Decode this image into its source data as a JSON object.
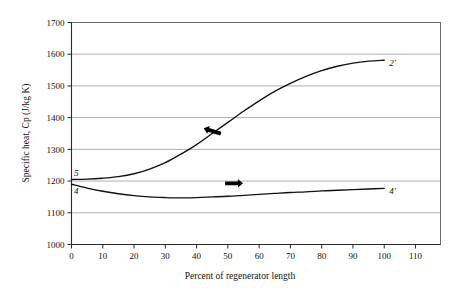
{
  "chart_data": {
    "type": "line",
    "title": "",
    "xlabel": "Percent of regenerator length",
    "ylabel": "Specific heat, Cp (J/kg K)",
    "xlim": [
      0,
      118
    ],
    "ylim": [
      1000,
      1700
    ],
    "xticks": [
      0,
      10,
      20,
      30,
      40,
      50,
      60,
      70,
      80,
      90,
      100,
      110
    ],
    "yticks": [
      1000,
      1100,
      1200,
      1300,
      1400,
      1500,
      1600,
      1700
    ],
    "grid": "horizontal",
    "legend": "none",
    "series": [
      {
        "name": "hot stream",
        "start_label": "5",
        "end_label": "2'",
        "x": [
          0,
          5,
          10,
          15,
          20,
          25,
          30,
          35,
          40,
          45,
          50,
          55,
          60,
          65,
          70,
          75,
          80,
          85,
          90,
          95,
          100
        ],
        "values": [
          1205,
          1206,
          1209,
          1214,
          1223,
          1238,
          1258,
          1285,
          1315,
          1350,
          1385,
          1420,
          1453,
          1483,
          1508,
          1530,
          1548,
          1562,
          1572,
          1578,
          1581
        ],
        "arrow": {
          "direction": "left",
          "x": 45,
          "y": 1358
        }
      },
      {
        "name": "cold stream",
        "start_label": "4",
        "end_label": "4'",
        "x": [
          0,
          5,
          10,
          15,
          20,
          25,
          30,
          35,
          40,
          45,
          50,
          55,
          60,
          65,
          70,
          75,
          80,
          85,
          90,
          95,
          100
        ],
        "values": [
          1190,
          1178,
          1168,
          1160,
          1154,
          1150,
          1148,
          1147,
          1148,
          1150,
          1152,
          1155,
          1158,
          1161,
          1164,
          1166,
          1169,
          1171,
          1173,
          1175,
          1177
        ],
        "arrow": {
          "direction": "right",
          "x": 52,
          "y": 1193
        }
      }
    ]
  },
  "axes": {
    "x_title": "Percent of regenerator length",
    "y_title": "Specific heat, Cp (J/kg K)",
    "x_tick_labels": [
      "0",
      "10",
      "20",
      "30",
      "40",
      "50",
      "60",
      "70",
      "80",
      "90",
      "100",
      "110"
    ],
    "y_tick_labels": [
      "1000",
      "1100",
      "1200",
      "1300",
      "1400",
      "1500",
      "1600",
      "1700"
    ]
  },
  "annotations": {
    "upper_start": "5",
    "upper_end": "2'",
    "lower_start": "4",
    "lower_end": "4'"
  },
  "colors": {
    "curve": "#111111",
    "gridline": "#9a9a9a",
    "frame": "#6e6e6e",
    "background": "#ffffff"
  }
}
